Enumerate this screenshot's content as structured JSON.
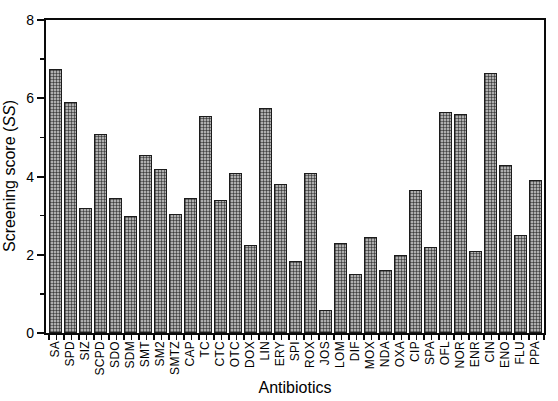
{
  "chart_data": {
    "type": "bar",
    "title": "",
    "xlabel": "Antibiotics",
    "ylabel": "Screening score (SS)",
    "ylabel_parts": {
      "prefix": "Screening score (",
      "italic": "SS",
      "suffix": ")"
    },
    "categories": [
      "SA",
      "SPD",
      "SIZ",
      "SCPD",
      "SDO",
      "SDM",
      "SMT",
      "SM2",
      "SMTZ",
      "CAP",
      "TC",
      "CTC",
      "OTC",
      "DOX",
      "LIN",
      "ERY",
      "SPI",
      "ROX",
      "JOS",
      "LOM",
      "DIF",
      "MOX",
      "NDA",
      "OXA",
      "CIP",
      "SPA",
      "OFL",
      "NOR",
      "ENR",
      "CIN",
      "ENO",
      "FLU",
      "PPA"
    ],
    "values": [
      6.75,
      5.9,
      3.2,
      5.1,
      3.45,
      3.0,
      4.55,
      4.2,
      3.05,
      3.45,
      5.55,
      3.4,
      4.1,
      2.25,
      5.75,
      3.8,
      1.85,
      4.1,
      0.6,
      2.3,
      1.5,
      2.45,
      1.6,
      2.0,
      3.65,
      2.2,
      5.65,
      5.6,
      2.1,
      6.65,
      4.3,
      2.5,
      3.9
    ],
    "ylim": [
      0,
      8
    ],
    "yticks": [
      0,
      2,
      4,
      6,
      8
    ],
    "yticks_minor": [
      1,
      3,
      5,
      7
    ],
    "xtick_label_rotation_deg": 90,
    "grid": false,
    "legend": null,
    "frame_box": true,
    "colors": {
      "background": "#ffffff",
      "bar_fill": "#aeaeae",
      "bar_pattern": "dark crosshatch grid",
      "bar_edge": "#1c1c1c",
      "axis": "#0a0a0a",
      "text": "#000000"
    }
  }
}
